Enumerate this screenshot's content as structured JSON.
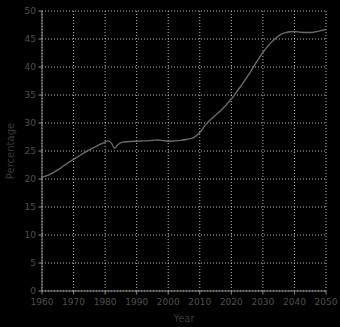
{
  "chart_data": {
    "type": "line",
    "title": "",
    "subtitle": "",
    "xlabel": "Year",
    "ylabel": "Percentage",
    "xlim": [
      1960,
      2050
    ],
    "ylim": [
      0,
      50
    ],
    "grid": true,
    "legend": null,
    "legend_position": "none",
    "xticks": [
      1960,
      1970,
      1980,
      1990,
      2000,
      2010,
      2020,
      2030,
      2040,
      2050
    ],
    "xtick_labels": [
      "1960",
      "1970",
      "1980",
      "1990",
      "2000",
      "2010",
      "2020",
      "2030",
      "2040",
      "2050"
    ],
    "yticks": [
      0,
      5,
      10,
      15,
      20,
      25,
      30,
      35,
      40,
      45,
      50
    ],
    "ytick_labels": [
      "0",
      "5",
      "10",
      "15",
      "20",
      "25",
      "30",
      "35",
      "40",
      "45",
      "50"
    ],
    "line_color": "#6b6b6b",
    "line_width": 1.4,
    "grid_color": "#e8e8e8",
    "axis_color": "#8a8a8a",
    "background_color": "#ffffff",
    "series": [
      {
        "name": "Percentage",
        "color": "#6b6b6b",
        "x": [
          1960,
          1962,
          1964,
          1966,
          1968,
          1970,
          1972,
          1974,
          1976,
          1978,
          1980,
          1981,
          1982,
          1983,
          1984,
          1985,
          1986,
          1988,
          1990,
          1992,
          1994,
          1996,
          1998,
          2000,
          2002,
          2004,
          2006,
          2008,
          2010,
          2012,
          2014,
          2016,
          2018,
          2020,
          2022,
          2024,
          2026,
          2028,
          2030,
          2032,
          2034,
          2036,
          2038,
          2040,
          2042,
          2044,
          2046,
          2048,
          2050
        ],
        "y": [
          20.3,
          20.7,
          21.3,
          22.0,
          22.8,
          23.5,
          24.2,
          24.9,
          25.5,
          26.1,
          26.6,
          26.8,
          26.4,
          25.5,
          26.1,
          26.5,
          26.6,
          26.7,
          26.75,
          26.8,
          26.85,
          26.95,
          26.9,
          26.75,
          26.8,
          26.9,
          27.1,
          27.4,
          28.3,
          29.8,
          30.9,
          31.9,
          33.0,
          34.3,
          35.8,
          37.4,
          39.1,
          40.9,
          42.6,
          44.0,
          45.1,
          45.9,
          46.25,
          46.35,
          46.2,
          46.15,
          46.2,
          46.45,
          46.7
        ]
      }
    ]
  }
}
